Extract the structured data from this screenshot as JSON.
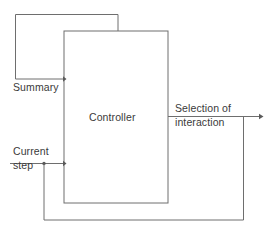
{
  "diagram": {
    "type": "block-diagram",
    "line_color": "#6e6e6e",
    "text_color": "#3a3a3a",
    "background_color": "#ffffff",
    "blocks": [
      {
        "id": "controller",
        "label": "Controller",
        "x": 64,
        "y": 31,
        "width": 104,
        "height": 172
      }
    ],
    "signals": [
      {
        "id": "summary",
        "label": "Summary",
        "direction": "feedback-top",
        "from": "controller-top",
        "to": "controller-left"
      },
      {
        "id": "current-step",
        "label": "Current\nstep",
        "label_line1": "Current",
        "label_line2": "step",
        "direction": "input",
        "to": "controller-left"
      },
      {
        "id": "selection-of-interaction",
        "label": "Selection of\ninteraction",
        "label_line1": "Selection of",
        "label_line2": "interaction",
        "direction": "output",
        "from": "controller-right"
      },
      {
        "id": "bottom-feedback",
        "label": "",
        "direction": "feedback-bottom",
        "from": "selection-of-interaction",
        "to": "current-step"
      }
    ]
  }
}
